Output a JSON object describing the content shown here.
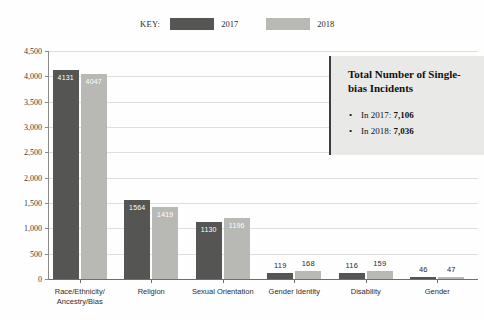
{
  "legend": {
    "key_label": "KEY:",
    "items": [
      {
        "label": "2017",
        "color": "#555553",
        "swatch_icon": "legend-swatch-2017"
      },
      {
        "label": "2018",
        "color": "#b8b8b5",
        "swatch_icon": "legend-swatch-2018"
      }
    ]
  },
  "callout": {
    "title": "Total Number of Single-bias Incidents",
    "items": [
      {
        "prefix": "In 2017: ",
        "value": "7,106"
      },
      {
        "prefix": "In 2018: ",
        "value": "7,036"
      }
    ]
  },
  "chart_data": {
    "type": "bar",
    "title": "",
    "xlabel": "",
    "ylabel": "",
    "grid": true,
    "legend_position": "top-center",
    "ylim": [
      0,
      4500
    ],
    "ytick_labels": [
      "0",
      "500",
      "1,000",
      "1,500",
      "2,000",
      "2,500",
      "3,000",
      "3,500",
      "4,000",
      "4,500"
    ],
    "ytick_values": [
      0,
      500,
      1000,
      1500,
      2000,
      2500,
      3000,
      3500,
      4000,
      4500
    ],
    "categories": [
      "Race/Ethnicity/\nAncestry/Bias",
      "Religion",
      "Sexual Orientation",
      "Gender Identity",
      "Disability",
      "Gender"
    ],
    "series": [
      {
        "name": "2017",
        "color": "#555553",
        "values": [
          4131,
          1564,
          1130,
          119,
          116,
          46
        ]
      },
      {
        "name": "2018",
        "color": "#b8b8b5",
        "values": [
          4047,
          1419,
          1196,
          168,
          159,
          47
        ]
      }
    ],
    "totals": {
      "2017": 7106,
      "2018": 7036
    }
  }
}
